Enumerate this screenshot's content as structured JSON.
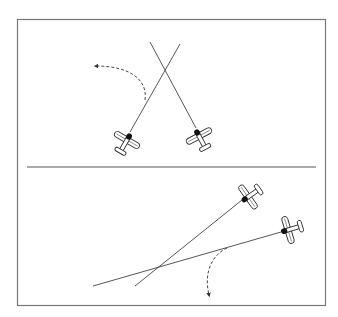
{
  "diagram": {
    "title": "",
    "panels": [
      {
        "id": "top",
        "description": "Two aircraft on crossing paths; left aircraft turns away to the left",
        "aircraft": [
          {
            "id": "left-aircraft",
            "heading_description": "climbing up-right"
          },
          {
            "id": "right-aircraft",
            "heading_description": "climbing up-left"
          }
        ],
        "maneuver_arrow": "dashed curved arrow turning left"
      },
      {
        "id": "bottom",
        "description": "Two aircraft on converging paths; lower aircraft turns away downward",
        "aircraft": [
          {
            "id": "upper-aircraft",
            "heading_description": "heading down-left"
          },
          {
            "id": "lower-aircraft",
            "heading_description": "heading left"
          }
        ],
        "maneuver_arrow": "dashed curved arrow turning down"
      }
    ],
    "colors": {
      "line": "#444444",
      "frame": "#777777",
      "aircraft_fill": "#ffffff",
      "aircraft_stroke": "#333333",
      "engine": "#111111"
    }
  }
}
